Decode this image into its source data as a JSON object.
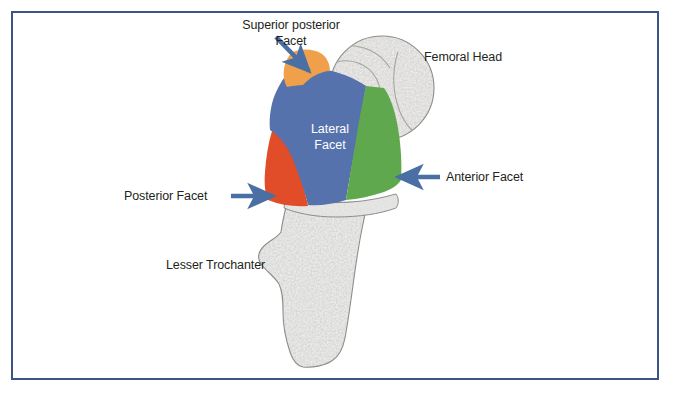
{
  "figure": {
    "frame_color": "#3a5488",
    "background_color": "#ffffff",
    "text_color": "#231f20",
    "arrow_color": "#4a6fa5"
  },
  "labels": {
    "superior_posterior_facet": "Superior posterior\nFacet",
    "femoral_head": "Femoral Head",
    "lateral_facet": "Lateral\nFacet",
    "anterior_facet": "Anterior Facet",
    "posterior_facet": "Posterior Facet",
    "lesser_trochanter": "Lesser Trochanter"
  },
  "facets": [
    {
      "name": "superior-posterior-facet",
      "label": "Superior posterior Facet",
      "color": "#f0a04a"
    },
    {
      "name": "lateral-facet",
      "label": "Lateral Facet",
      "color": "#5572ad"
    },
    {
      "name": "posterior-facet",
      "label": "Posterior Facet",
      "color": "#e04d28"
    },
    {
      "name": "anterior-facet",
      "label": "Anterior Facet",
      "color": "#5fa84e"
    }
  ],
  "bone_structures": [
    {
      "name": "femoral-head",
      "label": "Femoral Head",
      "color": "#e8e8e6"
    },
    {
      "name": "lesser-trochanter",
      "label": "Lesser Trochanter",
      "color": "#ececeb"
    }
  ],
  "footer": {
    "cut_text": "                              "
  }
}
